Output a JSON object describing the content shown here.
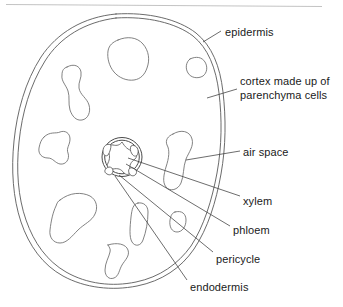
{
  "figure": {
    "name": "root-cross-section",
    "background_color": "#ffffff",
    "outline_color": "#5a5a5a",
    "text_color": "#1a1a1a",
    "rule_color": "#b4b4b4"
  },
  "labels": [
    {
      "id": "epidermis",
      "text": "epidermis",
      "x": 225,
      "y": 26,
      "lines": [
        "epidermis"
      ]
    },
    {
      "id": "cortex",
      "text": "cortex made up of parenchyma cells",
      "x": 240,
      "y": 75,
      "lines": [
        "cortex made up of",
        "parenchyma cells"
      ]
    },
    {
      "id": "air-space",
      "text": "air space",
      "x": 243,
      "y": 146,
      "lines": [
        "air space"
      ]
    },
    {
      "id": "xylem",
      "text": "xylem",
      "x": 243,
      "y": 195,
      "lines": [
        "xylem"
      ]
    },
    {
      "id": "phloem",
      "text": "phloem",
      "x": 233,
      "y": 224,
      "lines": [
        "phloem"
      ]
    },
    {
      "id": "pericycle",
      "text": "pericycle",
      "x": 216,
      "y": 253,
      "lines": [
        "pericycle"
      ]
    },
    {
      "id": "endodermis",
      "text": "endodermis",
      "x": 190,
      "y": 281,
      "lines": [
        "endodermis"
      ]
    }
  ],
  "structures": {
    "epidermis_layer": "double outer contour",
    "cortex_region": "area between epidermis and stele",
    "stele": "central double circle containing xylem and phloem",
    "xylem_shape": "star / cross shaped core",
    "phloem_patches": 4,
    "air_spaces_count": 8
  }
}
